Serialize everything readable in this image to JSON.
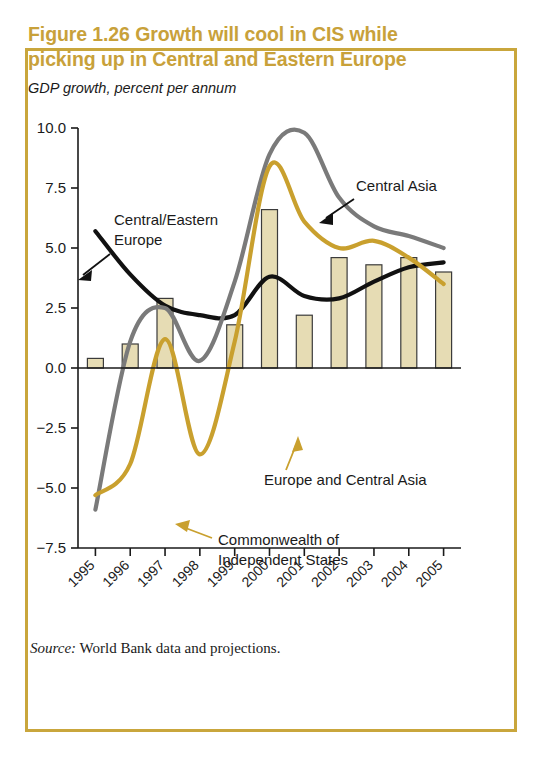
{
  "figure": {
    "title": "Figure 1.26  Growth will cool in CIS while picking up in Central and Eastern Europe",
    "subtitle": "GDP growth, percent per annum",
    "source_label": "Source:",
    "source_text": " World Bank data and projections."
  },
  "colors": {
    "frame": "#c9a63c",
    "title": "#c8a13a",
    "bar_fill": "#e6dcb4",
    "bar_stroke": "#3b3b3b",
    "cis_line": "#c9a02e",
    "central_asia_line": "#7a7a7a",
    "cee_line": "#111111",
    "axis": "#1a1a1a"
  },
  "chart_data": {
    "type": "line",
    "title": "Figure 1.26  Growth will cool in CIS while picking up in Central and Eastern Europe",
    "subtitle": "GDP growth, percent per annum",
    "xlabel": "",
    "ylabel": "GDP growth, percent per annum",
    "ylim": [
      -7.5,
      10.0
    ],
    "yticks": [
      10.0,
      7.5,
      5.0,
      2.5,
      0.0,
      -2.5,
      -5.0,
      -7.5
    ],
    "ytick_labels": [
      "10.0",
      "7.5",
      "5.0",
      "2.5",
      "0.0",
      "−2.5",
      "−5.0",
      "−7.5"
    ],
    "grid": false,
    "legend": "annotations",
    "categories": [
      "1995",
      "1996",
      "1997",
      "1998",
      "1999",
      "2000",
      "2001",
      "2002",
      "2003",
      "2004",
      "2005"
    ],
    "series": [
      {
        "name": "Europe and Central Asia",
        "kind": "bar",
        "color": "#e6dcb4",
        "values": [
          0.4,
          1.0,
          2.9,
          0.0,
          1.8,
          6.6,
          2.2,
          4.6,
          4.3,
          4.6,
          4.0
        ]
      },
      {
        "name": "Central/Eastern Europe",
        "kind": "line",
        "color": "#111111",
        "values": [
          5.7,
          3.9,
          2.6,
          2.2,
          2.2,
          3.8,
          3.0,
          2.9,
          3.6,
          4.2,
          4.4
        ]
      },
      {
        "name": "Central Asia",
        "kind": "line",
        "color": "#7a7a7a",
        "values": [
          -5.9,
          1.1,
          2.5,
          0.3,
          3.6,
          8.9,
          9.8,
          7.1,
          5.9,
          5.5,
          5.0
        ]
      },
      {
        "name": "Commonwealth of Independent States",
        "kind": "line",
        "color": "#c9a02e",
        "values": [
          -5.3,
          -4.0,
          1.2,
          -3.6,
          1.1,
          8.4,
          6.1,
          5.0,
          5.3,
          4.6,
          3.5
        ]
      }
    ],
    "annotations": [
      {
        "label": "Central/Eastern\nEurope",
        "target_series": "Central/Eastern Europe"
      },
      {
        "label": "Central Asia",
        "target_series": "Central Asia"
      },
      {
        "label": "Europe and Central Asia",
        "target_series": "Europe and Central Asia"
      },
      {
        "label": "Commonwealth of\nIndependent States",
        "target_series": "Commonwealth of Independent States"
      }
    ]
  },
  "annotations": {
    "cee_line1": "Central/Eastern",
    "cee_line2": "Europe",
    "central_asia": "Central Asia",
    "eca_bars": "Europe and Central Asia",
    "cis_line1": "Commonwealth of",
    "cis_line2": "Independent States"
  }
}
